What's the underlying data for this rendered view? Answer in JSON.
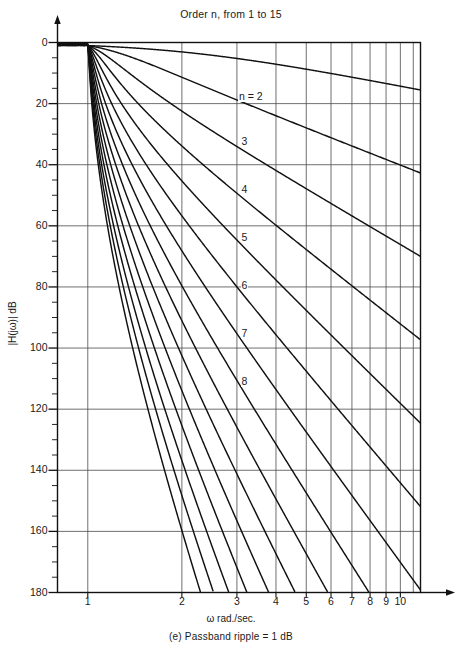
{
  "title": "Order n, from 1 to 15",
  "caption": "(e) Passband ripple = 1 dB",
  "axis": {
    "ylabel": "|H(jω)| dB",
    "xlabel": "ω rad./sec."
  },
  "yticks": [
    "0",
    "20",
    "40",
    "60",
    "80",
    "100",
    "120",
    "140",
    "160",
    "180"
  ],
  "xticks": [
    "1",
    "2",
    "3",
    "4",
    "5",
    "6",
    "7",
    "8",
    "9",
    "10"
  ],
  "curve_labels": [
    {
      "text": "n = 2",
      "x": 272,
      "y": 100
    },
    {
      "text": "3",
      "x": 284,
      "y": 168
    },
    {
      "text": "3",
      "x": 284,
      "y": 168
    },
    {
      "text": "4",
      "x": 284,
      "y": 240
    },
    {
      "text": "5",
      "x": 284,
      "y": 307
    },
    {
      "text": "6",
      "x": 284,
      "y": 373
    },
    {
      "text": "7",
      "x": 284,
      "y": 436
    },
    {
      "text": "8",
      "x": 284,
      "y": 494
    }
  ],
  "chart_data": {
    "type": "line",
    "title": "Order n, from 1 to 15",
    "subtitle": "(e) Passband ripple = 1 dB",
    "xlabel": "ω rad./sec.",
    "ylabel": "|H(jω)| dB",
    "xscale": "log",
    "xlim": [
      0.8,
      11.6
    ],
    "ylim": [
      180,
      0
    ],
    "yaxis_inverted": true,
    "grid": true,
    "legend": "inline-curve-labels",
    "xticks": [
      1,
      2,
      3,
      4,
      5,
      6,
      7,
      8,
      9,
      10
    ],
    "yticks": [
      0,
      20,
      40,
      60,
      80,
      100,
      120,
      140,
      160,
      180
    ],
    "y_minor_tick_step": 5,
    "filter": "Chebyshev Type I",
    "passband_ripple_dB": 1,
    "orders": [
      1,
      2,
      3,
      4,
      5,
      6,
      7,
      8,
      9,
      10,
      11,
      12,
      13,
      14,
      15
    ],
    "labeled_orders": [
      2,
      3,
      4,
      5,
      6,
      7,
      8
    ],
    "x": [
      1.0,
      1.1,
      1.2,
      1.3,
      1.5,
      1.7,
      2.0,
      2.5,
      3.0,
      4.0,
      5.0,
      6.0,
      8.0,
      10.0,
      11.5
    ],
    "series": [
      {
        "name": "n = 1",
        "order": 1,
        "values": [
          -1.0,
          -1.7,
          -2.5,
          -3.2,
          -4.6,
          -5.9,
          -7.6,
          -10.2,
          -12.3,
          -15.6,
          -18.1,
          -20.1,
          -23.2,
          -25.5,
          -26.8
        ]
      },
      {
        "name": "n = 2",
        "order": 2,
        "values": [
          -1.0,
          -2.9,
          -4.8,
          -6.6,
          -10.0,
          -12.9,
          -16.6,
          -22.3,
          -26.6,
          -33.2,
          -38.3,
          -42.4,
          -48.8,
          -53.7,
          -56.5
        ]
      },
      {
        "name": "n = 3",
        "order": 3,
        "values": [
          -1.0,
          -4.4,
          -7.6,
          -10.5,
          -15.5,
          -19.8,
          -25.3,
          -33.7,
          -40.1,
          -50.0,
          -57.6,
          -63.7,
          -73.3,
          -80.7,
          -84.9
        ]
      },
      {
        "name": "n = 4",
        "order": 4,
        "values": [
          -1.0,
          -6.1,
          -10.6,
          -14.6,
          -21.3,
          -27.0,
          -34.2,
          -45.2,
          -53.6,
          -66.7,
          -76.7,
          -84.8,
          -97.6,
          -107.4,
          -113.0
        ]
      },
      {
        "name": "n = 5",
        "order": 5,
        "values": [
          -1.0,
          -7.9,
          -13.7,
          -18.8,
          -27.2,
          -34.2,
          -43.2,
          -56.8,
          -67.3,
          -83.4,
          -95.8,
          -105.9,
          -121.9,
          -134.1,
          -141.1
        ]
      },
      {
        "name": "n = 6",
        "order": 6,
        "values": [
          -1.0,
          -9.8,
          -16.9,
          -23.1,
          -33.1,
          -41.5,
          -52.2,
          -68.4,
          -80.9,
          -100.2,
          -115.0,
          -127.1,
          -146.2,
          -160.9,
          -169.3
        ]
      },
      {
        "name": "n = 7",
        "order": 7,
        "values": [
          -1.0,
          -11.8,
          -20.2,
          -27.4,
          -39.1,
          -48.8,
          -61.2,
          -80.0,
          -94.5,
          -116.9,
          -134.1,
          -148.2,
          -170.5,
          -180.0,
          -180.0
        ]
      },
      {
        "name": "n = 8",
        "order": 8,
        "values": [
          -1.0,
          -13.8,
          -23.5,
          -31.8,
          -45.1,
          -56.1,
          -70.2,
          -91.6,
          -108.2,
          -133.7,
          -153.3,
          -169.4,
          -180.0,
          -180.0,
          -180.0
        ]
      },
      {
        "name": "n = 9",
        "order": 9,
        "values": [
          -1.0,
          -15.9,
          -26.9,
          -36.2,
          -51.1,
          -63.5,
          -79.2,
          -103.2,
          -121.8,
          -150.4,
          -172.5,
          -180.0,
          -180.0,
          -180.0,
          -180.0
        ]
      },
      {
        "name": "n = 10",
        "order": 10,
        "values": [
          -1.0,
          -18.0,
          -30.3,
          -40.7,
          -57.2,
          -70.9,
          -88.3,
          -114.8,
          -135.5,
          -167.2,
          -180.0,
          -180.0,
          -180.0,
          -180.0,
          -180.0
        ]
      },
      {
        "name": "n = 11",
        "order": 11,
        "values": [
          -1.0,
          -20.1,
          -33.7,
          -45.2,
          -63.3,
          -78.3,
          -97.3,
          -126.4,
          -149.1,
          -180.0,
          -180.0,
          -180.0,
          -180.0,
          -180.0,
          -180.0
        ]
      },
      {
        "name": "n = 12",
        "order": 12,
        "values": [
          -1.0,
          -22.3,
          -37.2,
          -49.7,
          -69.4,
          -85.7,
          -106.4,
          -138.0,
          -162.8,
          -180.0,
          -180.0,
          -180.0,
          -180.0,
          -180.0,
          -180.0
        ]
      },
      {
        "name": "n = 13",
        "order": 13,
        "values": [
          -1.0,
          -24.4,
          -40.6,
          -54.2,
          -75.5,
          -93.1,
          -115.4,
          -149.6,
          -176.4,
          -180.0,
          -180.0,
          -180.0,
          -180.0,
          -180.0,
          -180.0
        ]
      },
      {
        "name": "n = 14",
        "order": 14,
        "values": [
          -1.0,
          -26.6,
          -44.1,
          -58.8,
          -81.6,
          -100.5,
          -124.4,
          -161.2,
          -180.0,
          -180.0,
          -180.0,
          -180.0,
          -180.0,
          -180.0,
          -180.0
        ]
      },
      {
        "name": "n = 15",
        "order": 15,
        "values": [
          -1.0,
          -28.7,
          -47.5,
          -63.3,
          -87.7,
          -107.9,
          -133.5,
          -172.8,
          -180.0,
          -180.0,
          -180.0,
          -180.0,
          -180.0,
          -180.0,
          -180.0
        ]
      }
    ]
  }
}
